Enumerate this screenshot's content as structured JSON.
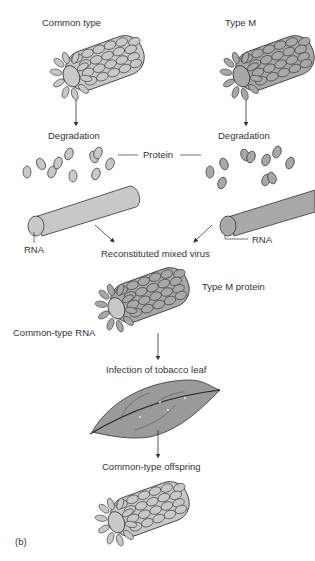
{
  "labels": {
    "common_type": "Common type",
    "type_m": "Type M",
    "degradation_left": "Degradation",
    "degradation_right": "Degradation",
    "protein": "Protein",
    "rna_left": "RNA",
    "rna_right": "RNA",
    "reconstituted": "Reconstituted mixed virus",
    "type_m_protein": "Type M protein",
    "common_type_rna": "Common-type RNA",
    "infection": "Infection of tobacco leaf",
    "offspring": "Common-type offspring",
    "panel": "(b)"
  },
  "colors": {
    "common_protein": "#c8c8c8",
    "type_m_protein": "#a8a8a8",
    "outline": "#333333",
    "leaf": "#9a9a9a"
  }
}
